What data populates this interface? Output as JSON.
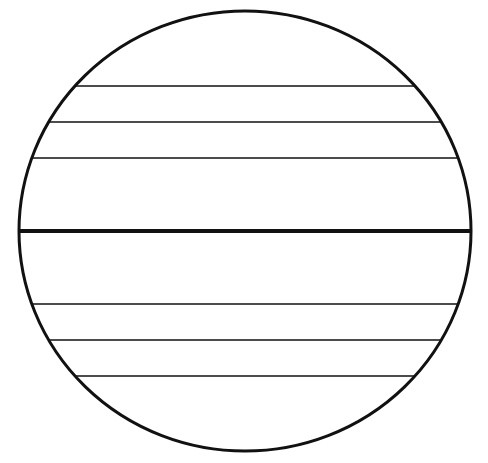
{
  "diagram": {
    "type": "circle-with-horizontal-chords",
    "canvas": {
      "width": 488,
      "height": 463
    },
    "background": "#ffffff",
    "stroke_color": "#111111",
    "circle": {
      "cx": 245,
      "cy": 231,
      "rx": 226,
      "ry": 220,
      "stroke_width": 3
    },
    "center_line": {
      "y": 231,
      "stroke_width": 4
    },
    "chords": [
      {
        "y": 86,
        "stroke_width": 1.5
      },
      {
        "y": 122,
        "stroke_width": 1.5
      },
      {
        "y": 158,
        "stroke_width": 1.5
      },
      {
        "y": 304,
        "stroke_width": 1.5
      },
      {
        "y": 340,
        "stroke_width": 1.5
      },
      {
        "y": 376,
        "stroke_width": 1.5
      }
    ],
    "chord_spacing": 36,
    "labels": []
  }
}
